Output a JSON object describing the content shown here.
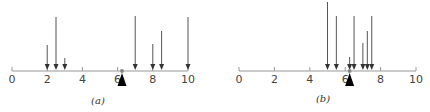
{
  "figure": {
    "panels": [
      {
        "id": "a",
        "caption": "(a)",
        "axis": {
          "min": 0,
          "max": 10,
          "ticks": [
            0,
            2,
            4,
            6,
            8,
            10
          ],
          "tick_labels": [
            "0",
            "2",
            "4",
            "6",
            "8",
            "10"
          ],
          "x0": 12,
          "x10": 188,
          "y": 71
        },
        "arrows": [
          {
            "pos": 2.0,
            "top": 45
          },
          {
            "pos": 2.5,
            "top": 17
          },
          {
            "pos": 3.0,
            "top": 58
          },
          {
            "pos": 7.0,
            "top": 16
          },
          {
            "pos": 8.0,
            "top": 44
          },
          {
            "pos": 8.5,
            "top": 31
          },
          {
            "pos": 10.0,
            "top": 17
          }
        ],
        "fulcrum": 6.25,
        "caption_x": 98,
        "caption_y": 104
      },
      {
        "id": "b",
        "caption": "(b)",
        "axis": {
          "min": 0,
          "max": 10,
          "ticks": [
            0,
            2,
            4,
            6,
            8,
            10
          ],
          "tick_labels": [
            "0",
            "2",
            "4",
            "6",
            "8",
            "10"
          ],
          "x0": 239,
          "x10": 416,
          "y": 71
        },
        "arrows": [
          {
            "pos": 5.0,
            "top": 2
          },
          {
            "pos": 5.5,
            "top": 16
          },
          {
            "pos": 6.25,
            "top": 57
          },
          {
            "pos": 6.5,
            "top": 16
          },
          {
            "pos": 7.0,
            "top": 43
          },
          {
            "pos": 7.25,
            "top": 31
          },
          {
            "pos": 7.5,
            "top": 16
          }
        ],
        "fulcrum": 6.25,
        "caption_x": 323,
        "caption_y": 102
      }
    ],
    "colors": {
      "axis": "#999999",
      "arrow": "#555555",
      "fulcrum": "#000000",
      "dot": "#888888"
    }
  }
}
